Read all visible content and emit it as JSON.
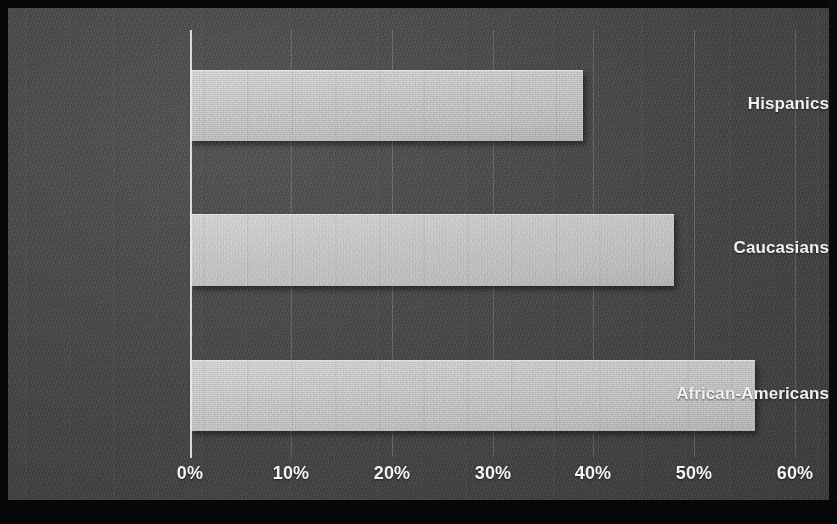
{
  "chart_data": {
    "type": "bar",
    "orientation": "horizontal",
    "title": "",
    "subtitle": "",
    "xlabel": "",
    "ylabel": "",
    "categories": [
      "Hispanics",
      "Caucasians",
      "African-Americans"
    ],
    "values": [
      39,
      48,
      56
    ],
    "value_suffix": "%",
    "xlim": [
      0,
      60
    ],
    "xticks": [
      0,
      10,
      20,
      30,
      40,
      50,
      60
    ],
    "xtick_labels": [
      "0%",
      "10%",
      "20%",
      "30%",
      "40%",
      "50%",
      "60%"
    ],
    "grid": true,
    "grid_axis": "x",
    "legend": false,
    "legend_position": "none",
    "series": [
      {
        "name": "",
        "values": [
          39,
          48,
          56
        ]
      }
    ],
    "colors": {
      "background": "#4a4a4a",
      "bar_fill": "#cfcfcf",
      "text": "#f2f2f2",
      "axis": "#eeeeee",
      "gridline": "#6d6d6d",
      "frame": "#080808"
    }
  },
  "axis": {
    "tick_labels": [
      "0%",
      "10%",
      "20%",
      "30%",
      "40%",
      "50%",
      "60%"
    ]
  },
  "bars": [
    {
      "label": "Hispanics",
      "value": 39
    },
    {
      "label": "Caucasians",
      "value": 48
    },
    {
      "label": "African-Americans",
      "value": 56
    }
  ]
}
